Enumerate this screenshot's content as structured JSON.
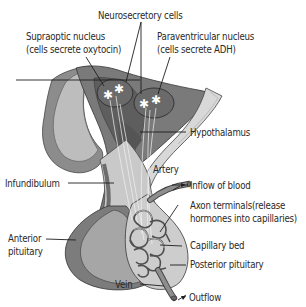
{
  "diagram": {
    "labels": {
      "neurosecretory": "Neurosecretory cells",
      "supraoptic_1": "Supraoptic nucleus",
      "supraoptic_2": "(cells secrete oxytocin)",
      "paraventricular_1": "Paraventricular nucleus",
      "paraventricular_2": "(cells secrete ADH)",
      "hypothalamus": "Hypothalamus",
      "artery": "Artery",
      "infundibulum": "Infundibulum",
      "inflow": "Inflow of blood",
      "axon_1": "Axon terminals(release",
      "axon_2": "hormones into capillaries)",
      "anterior_1": "Anterior",
      "anterior_2": "pituitary",
      "capillary_bed": "Capillary bed",
      "posterior": "Posterior pituitary",
      "vein": "Vein",
      "outflow": "Outflow"
    },
    "colors": {
      "dark_tissue": "#6f6f6f",
      "mid_tissue": "#9a9a9a",
      "light_tissue": "#c4c4c4",
      "pale_tissue": "#d6d6d6",
      "vessel": "#8a8a8a",
      "text": "#2a2a2a"
    }
  }
}
